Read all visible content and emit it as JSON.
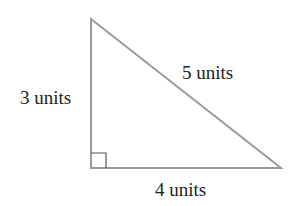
{
  "diagram": {
    "type": "right-triangle",
    "colors": {
      "stroke": "#9a9a9a",
      "right_angle_marker": "#555555",
      "text": "#222222",
      "background": "#ffffff"
    },
    "vertices": {
      "top": [
        91,
        19
      ],
      "right_angle": [
        91,
        168
      ],
      "right": [
        281,
        168
      ]
    },
    "labels": {
      "vertical_side": "3 units",
      "hypotenuse": "5 units",
      "horizontal_side": "4 units"
    }
  }
}
